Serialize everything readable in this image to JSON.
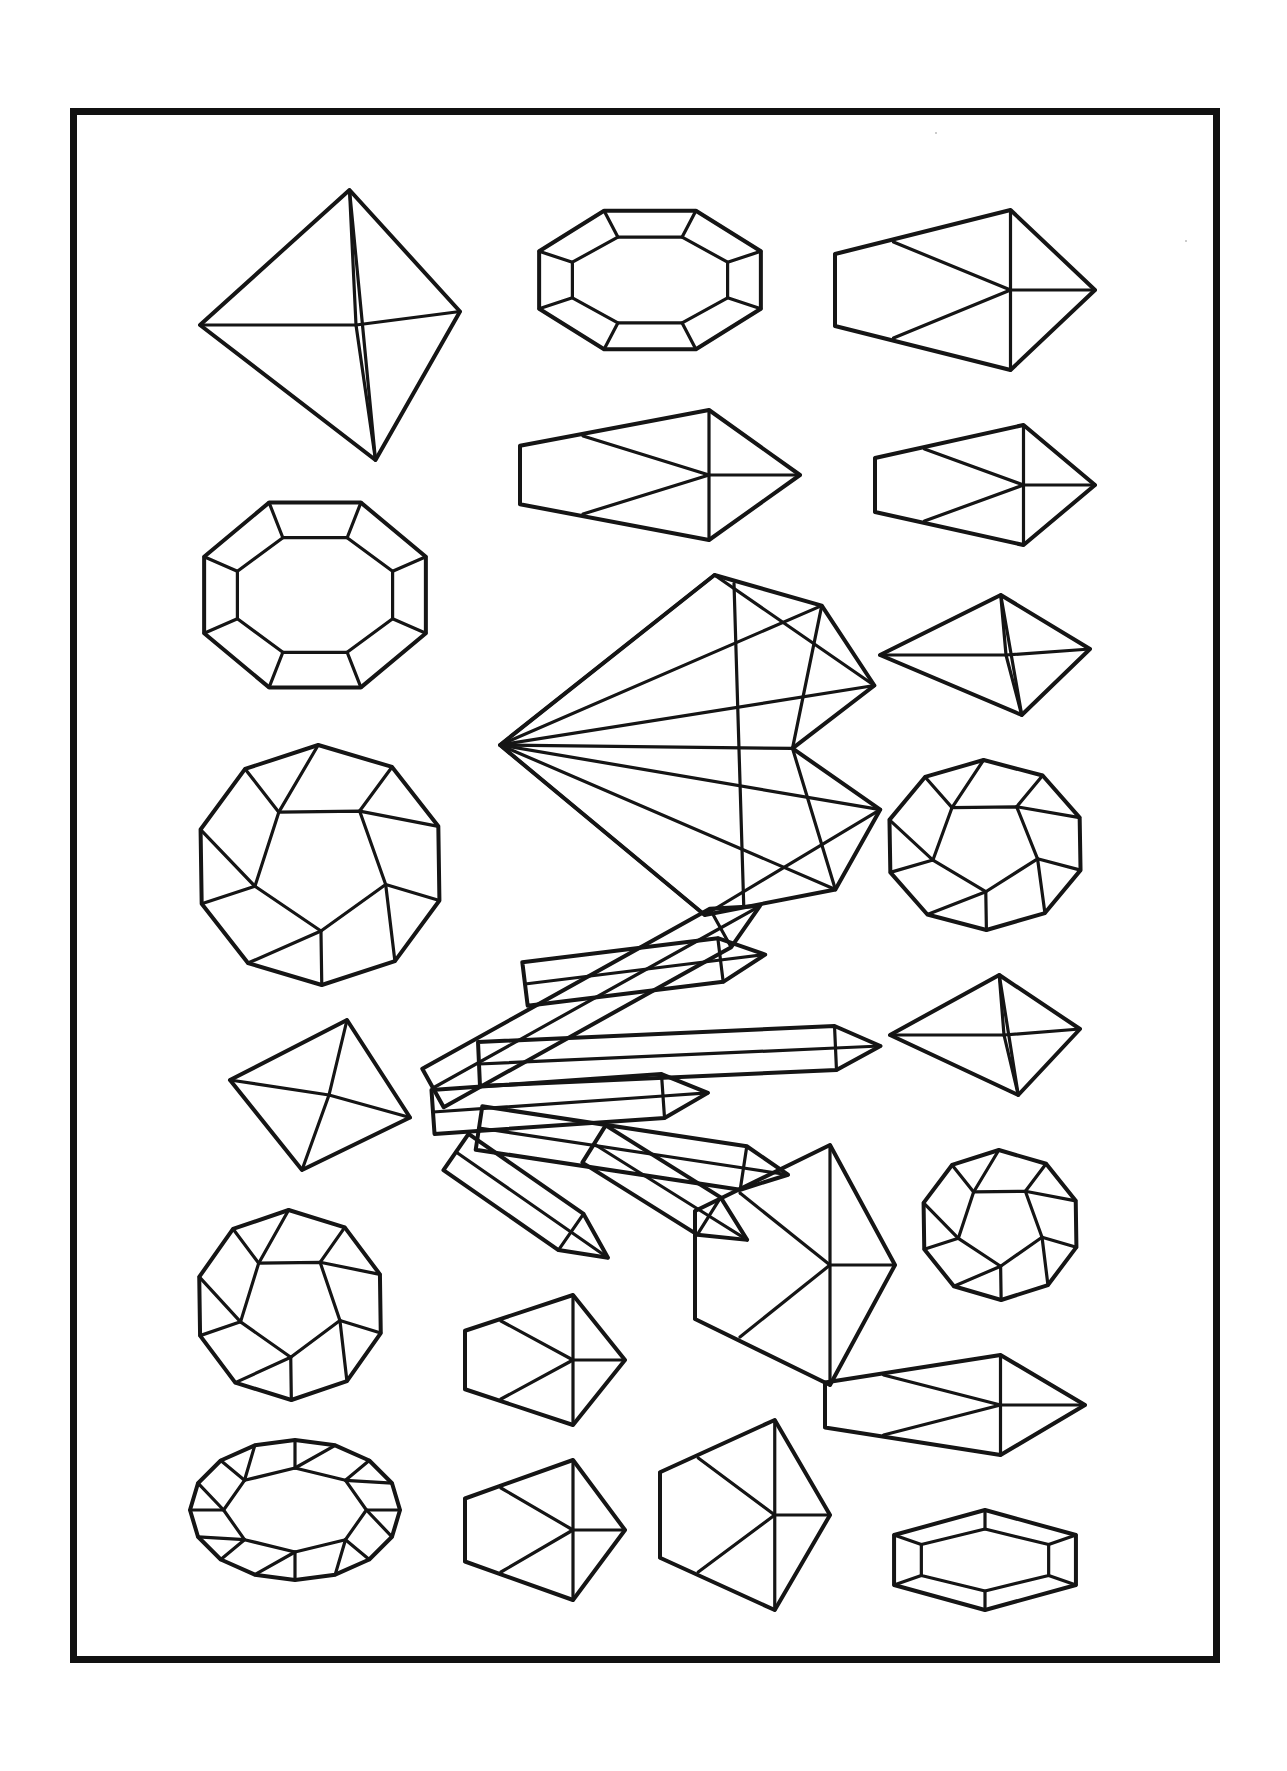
{
  "page": {
    "type": "coloring-page",
    "background_color": "#ffffff",
    "line_color": "#151515",
    "frame": {
      "x": 70,
      "y": 108,
      "width": 1150,
      "height": 1555,
      "border_width": 7,
      "color": "#111111"
    }
  },
  "gems": [
    {
      "name": "trillion-pear-gem",
      "cx": 330,
      "cy": 325,
      "w": 260,
      "h": 270
    },
    {
      "name": "emerald-cut-gem-top",
      "cx": 650,
      "cy": 280,
      "w": 240,
      "h": 150
    },
    {
      "name": "hexagonal-prism-crystal",
      "cx": 965,
      "cy": 290,
      "w": 260,
      "h": 160
    },
    {
      "name": "long-pointed-crystal",
      "cx": 660,
      "cy": 475,
      "w": 280,
      "h": 130
    },
    {
      "name": "small-pointed-prism",
      "cx": 985,
      "cy": 485,
      "w": 220,
      "h": 120
    },
    {
      "name": "octagon-cushion-gem",
      "cx": 315,
      "cy": 595,
      "w": 240,
      "h": 200
    },
    {
      "name": "heart-gem",
      "cx": 695,
      "cy": 745,
      "w": 390,
      "h": 340
    },
    {
      "name": "marquise-gem",
      "cx": 985,
      "cy": 655,
      "w": 210,
      "h": 120
    },
    {
      "name": "round-brilliant-tilted",
      "cx": 320,
      "cy": 865,
      "w": 250,
      "h": 240
    },
    {
      "name": "faceted-nugget",
      "cx": 985,
      "cy": 845,
      "w": 200,
      "h": 170
    },
    {
      "name": "crystal-cluster",
      "cx": 640,
      "cy": 1080,
      "w": 460,
      "h": 320
    },
    {
      "name": "trillion-small",
      "cx": 320,
      "cy": 1095,
      "w": 180,
      "h": 150
    },
    {
      "name": "kite-gem",
      "cx": 985,
      "cy": 1035,
      "w": 190,
      "h": 120
    },
    {
      "name": "round-octagon-gem",
      "cx": 290,
      "cy": 1305,
      "w": 190,
      "h": 190
    },
    {
      "name": "pointed-shard-crystal",
      "cx": 795,
      "cy": 1265,
      "w": 200,
      "h": 240
    },
    {
      "name": "rounded-barrel-gem",
      "cx": 1000,
      "cy": 1225,
      "w": 160,
      "h": 150
    },
    {
      "name": "box-prism-gem",
      "cx": 545,
      "cy": 1360,
      "w": 160,
      "h": 130
    },
    {
      "name": "long-prism-crystal",
      "cx": 955,
      "cy": 1405,
      "w": 260,
      "h": 100
    },
    {
      "name": "oval-rose-cut-gem",
      "cx": 295,
      "cy": 1510,
      "w": 210,
      "h": 140
    },
    {
      "name": "barrel-prism-small",
      "cx": 545,
      "cy": 1530,
      "w": 160,
      "h": 140
    },
    {
      "name": "tall-pointed-crystal",
      "cx": 745,
      "cy": 1515,
      "w": 170,
      "h": 190
    },
    {
      "name": "elongated-hexagon-gem",
      "cx": 985,
      "cy": 1560,
      "w": 210,
      "h": 100
    }
  ]
}
